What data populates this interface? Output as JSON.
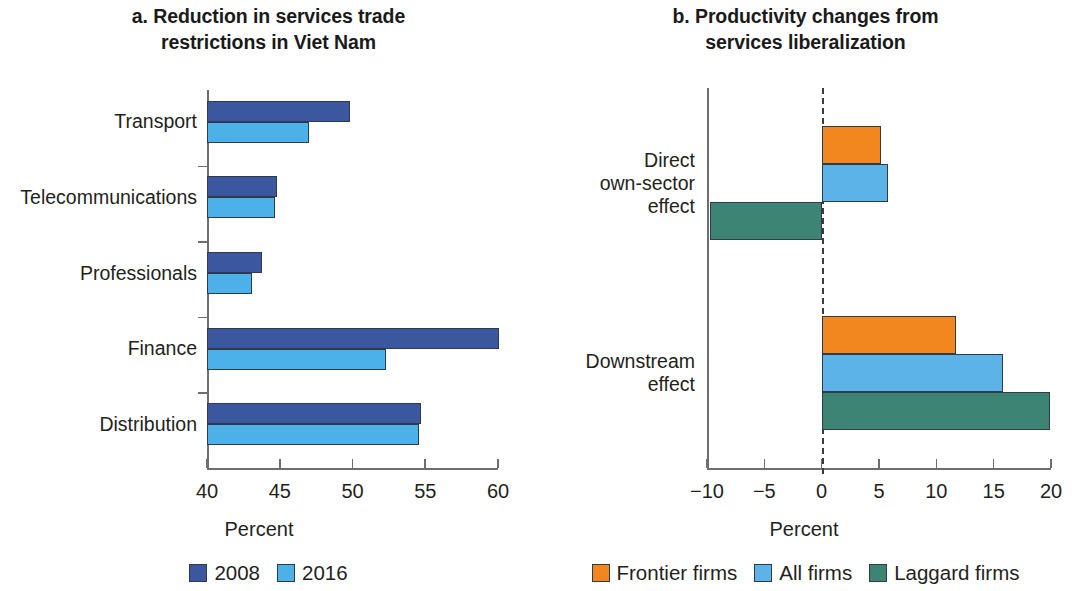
{
  "figure": {
    "panel_a": {
      "title_line1": "a. Reduction in services trade",
      "title_line2": "restrictions in Viet Nam",
      "axis_caption": "Percent",
      "legend": [
        {
          "label": "2008",
          "color": "#3a579f"
        },
        {
          "label": "2016",
          "color": "#4cb1e8"
        }
      ]
    },
    "panel_b": {
      "title_line1": "b. Productivity changes from",
      "title_line2": "services liberalization",
      "axis_caption": "Percent",
      "legend": [
        {
          "label": "Frontier firms",
          "color": "#f3871f"
        },
        {
          "label": "All firms",
          "color": "#5cb3e8"
        },
        {
          "label": "Laggard firms",
          "color": "#3d8474"
        }
      ]
    }
  },
  "chart_data": [
    {
      "type": "bar",
      "orientation": "horizontal",
      "title": "a. Reduction in services trade restrictions in Viet Nam",
      "xlabel": "Percent",
      "ylabel": "",
      "xlim": [
        40,
        60
      ],
      "xticks": [
        40,
        45,
        50,
        55,
        60
      ],
      "grid": false,
      "legend_position": "bottom",
      "categories": [
        "Transport",
        "Telecommunications",
        "Professionals",
        "Finance",
        "Distribution"
      ],
      "series": [
        {
          "name": "2008",
          "color": "#3a579f",
          "values": [
            49.8,
            44.8,
            43.8,
            60.1,
            54.7
          ]
        },
        {
          "name": "2016",
          "color": "#4cb1e8",
          "values": [
            47.0,
            44.7,
            43.1,
            52.3,
            54.6
          ]
        }
      ]
    },
    {
      "type": "bar",
      "orientation": "horizontal",
      "title": "b. Productivity changes from services liberalization",
      "xlabel": "Percent",
      "ylabel": "",
      "xlim": [
        -10,
        20
      ],
      "xticks": [
        -10,
        -5,
        0,
        5,
        10,
        15,
        20
      ],
      "xtick_labels": [
        "−10",
        "−5",
        "0",
        "5",
        "10",
        "15",
        "20"
      ],
      "grid": false,
      "zero_reference_line": true,
      "legend_position": "bottom",
      "categories": [
        "Direct\nown-sector\neffect",
        "Downstream\neffect"
      ],
      "series": [
        {
          "name": "Frontier firms",
          "color": "#f3871f",
          "values": [
            5.2,
            11.7
          ]
        },
        {
          "name": "All firms",
          "color": "#5cb3e8",
          "values": [
            5.8,
            15.8
          ]
        },
        {
          "name": "Laggard firms",
          "color": "#3d8474",
          "values": [
            -9.7,
            19.9
          ]
        }
      ]
    }
  ]
}
